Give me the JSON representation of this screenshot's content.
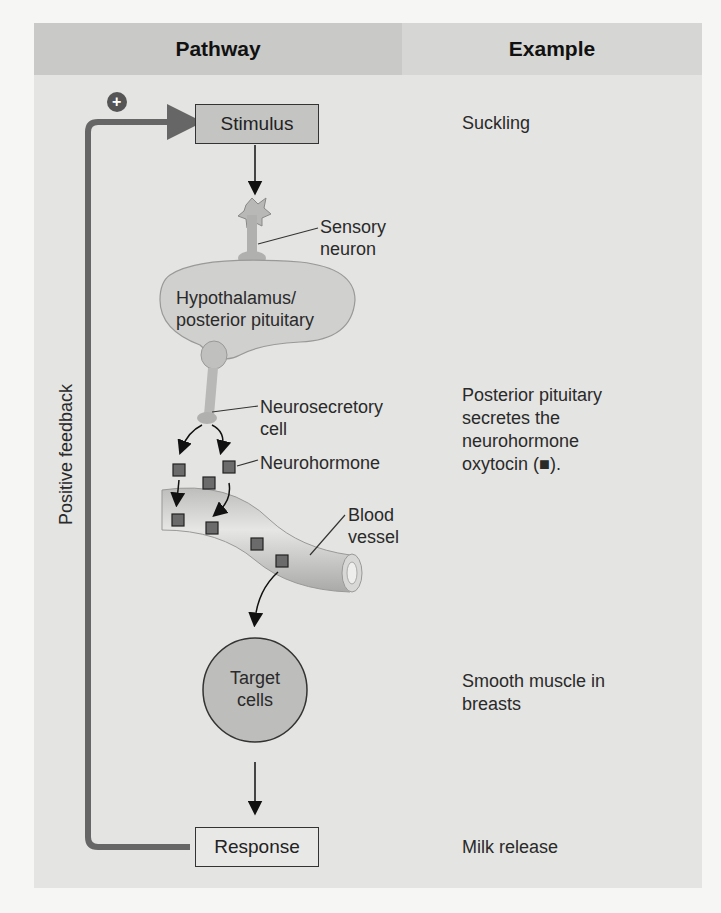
{
  "headers": {
    "pathway": "Pathway",
    "example": "Example"
  },
  "pathway": {
    "stimulus": "Stimulus",
    "sensory_neuron": [
      "Sensory",
      "neuron"
    ],
    "hypothalamus": [
      "Hypothalamus/",
      "posterior pituitary"
    ],
    "neurosecretory_cell": [
      "Neurosecretory",
      "cell"
    ],
    "neurohormone": "Neurohormone",
    "blood_vessel": [
      "Blood",
      "vessel"
    ],
    "target_cells": [
      "Target",
      "cells"
    ],
    "response": "Response",
    "feedback_label": "Positive feedback",
    "feedback_sign": "+"
  },
  "examples": {
    "stimulus": "Suckling",
    "secretion": [
      "Posterior pituitary",
      "secretes the",
      "neurohormone",
      "oxytocin (■)."
    ],
    "target": [
      "Smooth muscle in",
      "breasts"
    ],
    "response": "Milk release"
  },
  "colors": {
    "panel": "#e4e4e2",
    "header_left": "#c9c9c7",
    "header_right": "#d6d6d4",
    "feedback_line": "#666666",
    "hormone": "#6b6b6b",
    "box_fill": "#c4c4c2"
  }
}
